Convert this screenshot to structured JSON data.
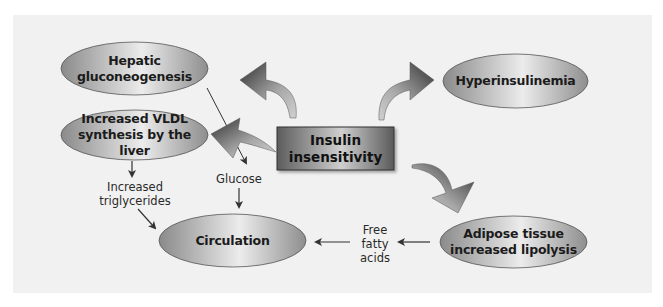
{
  "diagram": {
    "center": {
      "label_line1": "Insulin",
      "label_line2": "insensitivity"
    },
    "nodes": {
      "hepatic": {
        "line1": "Hepatic",
        "line2": "gluconeogenesis"
      },
      "vldl": {
        "line1": "Increased VLDL",
        "line2": "synthesis by the liver"
      },
      "hyperinsulinemia": {
        "line1": "Hyperinsulinemia"
      },
      "circulation": {
        "line1": "Circulation"
      },
      "adipose": {
        "line1": "Adipose tissue",
        "line2": "increased lipolysis"
      }
    },
    "labels": {
      "triglycerides": {
        "line1": "Increased",
        "line2": "triglycerides"
      },
      "glucose": {
        "line1": "Glucose"
      },
      "ffa": {
        "line1": "Free",
        "line2": "fatty",
        "line3": "acids"
      }
    },
    "colors": {
      "panel": "#f1f1f1",
      "ellipse_dark": "#8c8c8c",
      "ellipse_light": "#ececec",
      "box_dark": "#5e5e5e",
      "box_light": "#c9c9c9",
      "arrow_dark": "#3a3a3a",
      "arrow_light": "#c8c8c8",
      "line": "#333333"
    },
    "edges": [
      {
        "from": "Insulin insensitivity",
        "to": "Hepatic gluconeogenesis",
        "style": "big-curved"
      },
      {
        "from": "Insulin insensitivity",
        "to": "Hyperinsulinemia",
        "style": "big-curved"
      },
      {
        "from": "Insulin insensitivity",
        "to": "Increased VLDL synthesis by the liver",
        "style": "big-curved"
      },
      {
        "from": "Insulin insensitivity",
        "to": "Adipose tissue increased lipolysis",
        "style": "big-curved"
      },
      {
        "from": "Hepatic gluconeogenesis",
        "to": "Glucose",
        "style": "thin"
      },
      {
        "from": "Increased VLDL synthesis by the liver",
        "to": "Increased triglycerides",
        "style": "thin"
      },
      {
        "from": "Increased triglycerides",
        "to": "Circulation",
        "style": "thin"
      },
      {
        "from": "Glucose",
        "to": "Circulation",
        "style": "thin"
      },
      {
        "from": "Adipose tissue increased lipolysis",
        "to": "Free fatty acids",
        "style": "thin"
      },
      {
        "from": "Free fatty acids",
        "to": "Circulation",
        "style": "thin"
      }
    ]
  }
}
